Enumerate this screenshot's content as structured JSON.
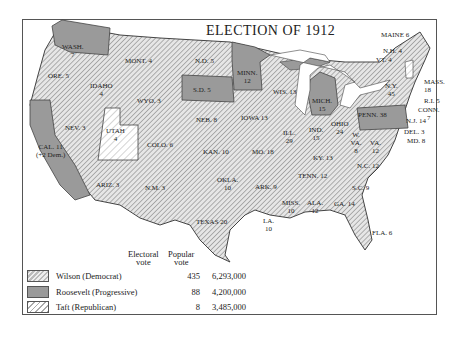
{
  "map": {
    "title": "ELECTION OF 1912",
    "colors": {
      "wilson_fill": "#c8c8c8",
      "roosevelt_fill": "#9a9a9a",
      "taft_fill": "#ffffff",
      "border": "#444444"
    },
    "states": [
      {
        "abbr": "WASH.",
        "ev": "7",
        "winner": "Roosevelt"
      },
      {
        "abbr": "ORE.",
        "ev": "5",
        "winner": "Wilson"
      },
      {
        "abbr": "CAL.",
        "ev": "11",
        "note": "(+2 Dem.)",
        "winner": "Roosevelt"
      },
      {
        "abbr": "IDAHO",
        "ev": "4",
        "winner": "Wilson"
      },
      {
        "abbr": "NEV.",
        "ev": "3",
        "winner": "Wilson"
      },
      {
        "abbr": "MONT.",
        "ev": "4",
        "winner": "Wilson"
      },
      {
        "abbr": "WYO.",
        "ev": "3",
        "winner": "Wilson"
      },
      {
        "abbr": "UTAH",
        "ev": "4",
        "winner": "Taft"
      },
      {
        "abbr": "COLO.",
        "ev": "6",
        "winner": "Wilson"
      },
      {
        "abbr": "ARIZ.",
        "ev": "3",
        "winner": "Wilson"
      },
      {
        "abbr": "N.M.",
        "ev": "3",
        "winner": "Wilson"
      },
      {
        "abbr": "N.D.",
        "ev": "5",
        "winner": "Wilson"
      },
      {
        "abbr": "S.D.",
        "ev": "5",
        "winner": "Roosevelt"
      },
      {
        "abbr": "NEB.",
        "ev": "8",
        "winner": "Wilson"
      },
      {
        "abbr": "KAN.",
        "ev": "10",
        "winner": "Wilson"
      },
      {
        "abbr": "OKLA.",
        "ev": "10",
        "winner": "Wilson"
      },
      {
        "abbr": "TEXAS",
        "ev": "20",
        "winner": "Wilson"
      },
      {
        "abbr": "MINN.",
        "ev": "12",
        "winner": "Roosevelt"
      },
      {
        "abbr": "IOWA",
        "ev": "13",
        "winner": "Wilson"
      },
      {
        "abbr": "MO.",
        "ev": "18",
        "winner": "Wilson"
      },
      {
        "abbr": "ARK.",
        "ev": "9",
        "winner": "Wilson"
      },
      {
        "abbr": "LA.",
        "ev": "10",
        "winner": "Wilson"
      },
      {
        "abbr": "WIS.",
        "ev": "13",
        "winner": "Wilson"
      },
      {
        "abbr": "ILL.",
        "ev": "29",
        "winner": "Wilson"
      },
      {
        "abbr": "MICH.",
        "ev": "15",
        "winner": "Roosevelt"
      },
      {
        "abbr": "IND.",
        "ev": "15",
        "winner": "Wilson"
      },
      {
        "abbr": "OHIO",
        "ev": "24",
        "winner": "Wilson"
      },
      {
        "abbr": "KY.",
        "ev": "13",
        "winner": "Wilson"
      },
      {
        "abbr": "TENN.",
        "ev": "12",
        "winner": "Wilson"
      },
      {
        "abbr": "MISS.",
        "ev": "10",
        "winner": "Wilson"
      },
      {
        "abbr": "ALA.",
        "ev": "12",
        "winner": "Wilson"
      },
      {
        "abbr": "GA.",
        "ev": "14",
        "winner": "Wilson"
      },
      {
        "abbr": "FLA.",
        "ev": "6",
        "winner": "Wilson"
      },
      {
        "abbr": "S.C.",
        "ev": "9",
        "winner": "Wilson"
      },
      {
        "abbr": "N.C.",
        "ev": "12",
        "winner": "Wilson"
      },
      {
        "abbr": "VA.",
        "ev": "12",
        "winner": "Wilson"
      },
      {
        "abbr": "W. VA.",
        "ev": "8",
        "winner": "Wilson"
      },
      {
        "abbr": "PENN.",
        "ev": "38",
        "winner": "Roosevelt"
      },
      {
        "abbr": "N.Y.",
        "ev": "45",
        "winner": "Wilson"
      },
      {
        "abbr": "MAINE",
        "ev": "6",
        "winner": "Wilson"
      },
      {
        "abbr": "N.H.",
        "ev": "4",
        "winner": "Wilson"
      },
      {
        "abbr": "VT.",
        "ev": "4",
        "winner": "Taft"
      },
      {
        "abbr": "MASS.",
        "ev": "18",
        "winner": "Wilson"
      },
      {
        "abbr": "R.I.",
        "ev": "5",
        "winner": "Wilson"
      },
      {
        "abbr": "CONN.",
        "ev": "7",
        "winner": "Wilson"
      },
      {
        "abbr": "N.J.",
        "ev": "14",
        "winner": "Wilson"
      },
      {
        "abbr": "DEL.",
        "ev": "3",
        "winner": "Wilson"
      },
      {
        "abbr": "MD.",
        "ev": "8",
        "winner": "Wilson"
      }
    ]
  },
  "legend": {
    "col_electoral": "Electoral",
    "col_electoral_sub": "vote",
    "col_popular": "Popular",
    "col_popular_sub": "vote",
    "rows": [
      {
        "candidate": "Wilson (Democrat)",
        "electoral": "435",
        "popular": "6,293,000"
      },
      {
        "candidate": "Roosevelt (Progressive)",
        "electoral": "88",
        "popular": "4,200,000"
      },
      {
        "candidate": "Taft (Republican)",
        "electoral": "8",
        "popular": "3,485,000"
      }
    ]
  }
}
